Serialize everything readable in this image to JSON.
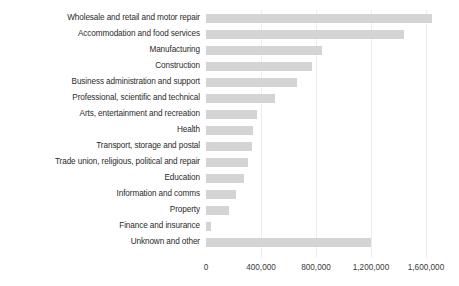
{
  "chart_data": {
    "type": "bar",
    "orientation": "horizontal",
    "title": "",
    "xlabel": "",
    "ylabel": "",
    "xlim": [
      0,
      1700000
    ],
    "xticks": [
      0,
      400000,
      800000,
      1200000,
      1600000
    ],
    "xtick_labels": [
      "0",
      "400,000",
      "800,000",
      "1,200,000",
      "1,600,000"
    ],
    "grid": true,
    "legend": false,
    "bar_color": "#d4d4d4",
    "categories": [
      "Wholesale and retail and motor repair",
      "Accommodation and food services",
      "Manufacturing",
      "Construction",
      "Business administration and support",
      "Professional, scientific and technical",
      "Arts, entertainment and recreation",
      "Health",
      "Transport, storage and postal",
      "Trade union, religious, political and repair",
      "Education",
      "Information and comms",
      "Property",
      "Finance and insurance",
      "Unknown and other"
    ],
    "values": [
      1640000,
      1440000,
      840000,
      770000,
      660000,
      500000,
      370000,
      340000,
      335000,
      305000,
      275000,
      220000,
      165000,
      35000,
      1200000
    ]
  }
}
